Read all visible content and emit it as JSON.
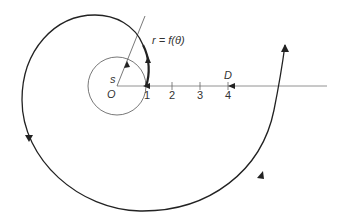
{
  "diagram": {
    "type": "polar spiral path diagram",
    "labels": {
      "curve_equation": "r = f(θ)",
      "origin": "O",
      "start_point": "s",
      "destination": "D"
    },
    "axis_ticks": [
      "1",
      "2",
      "3",
      "4"
    ],
    "colors": {
      "stroke": "#222222",
      "thin_stroke": "#555555",
      "text": "#333333",
      "background": "#ffffff"
    }
  }
}
